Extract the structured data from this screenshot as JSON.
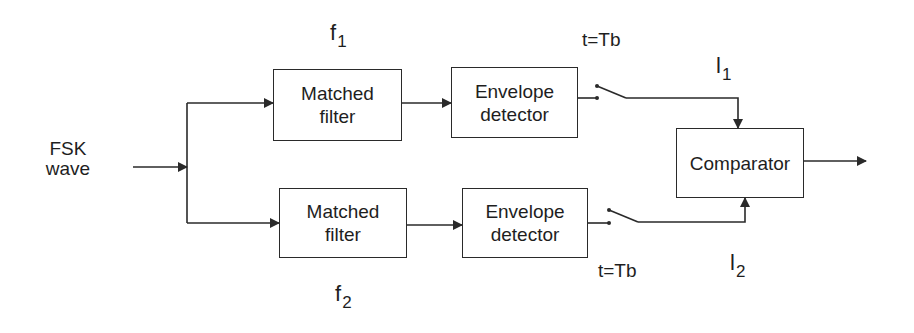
{
  "diagram": {
    "input": {
      "line1": "FSK",
      "line2": "wave"
    },
    "upper_branch": {
      "frequency_symbol": "f",
      "frequency_subscript": "1",
      "matched_filter": {
        "line1": "Matched",
        "line2": "filter"
      },
      "envelope_detector": {
        "line1": "Envelope",
        "line2": "detector"
      },
      "sampler_label": "t=Tb",
      "output_symbol": "l",
      "output_subscript": "1"
    },
    "lower_branch": {
      "frequency_symbol": "f",
      "frequency_subscript": "2",
      "matched_filter": {
        "line1": "Matched",
        "line2": "filter"
      },
      "envelope_detector": {
        "line1": "Envelope",
        "line2": "detector"
      },
      "sampler_label": "t=Tb",
      "output_symbol": "l",
      "output_subscript": "2"
    },
    "comparator": {
      "label": "Comparator"
    },
    "colors": {
      "line": "#2a2a2a",
      "text": "#1e1e1e",
      "background": "#ffffff"
    }
  }
}
